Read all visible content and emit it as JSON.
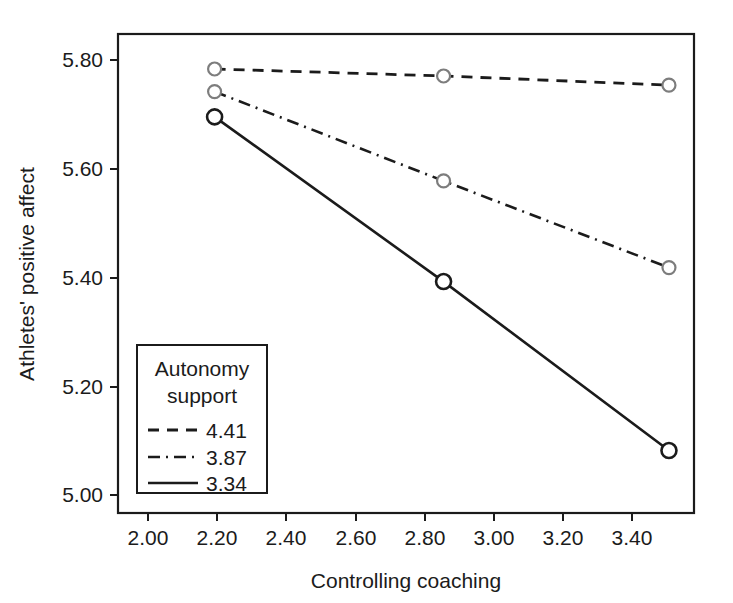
{
  "chart_data": {
    "type": "line",
    "title": "",
    "xlabel": "Controlling coaching",
    "ylabel": "Athletes' positive affect",
    "xlim": [
      1.92,
      3.53
    ],
    "ylim": [
      4.955,
      5.845
    ],
    "xticks": [
      "2.00",
      "2.20",
      "2.40",
      "2.60",
      "2.80",
      "3.00",
      "3.20",
      "3.40"
    ],
    "xtick_values": [
      2.0,
      2.2,
      2.4,
      2.6,
      2.8,
      3.0,
      3.2,
      3.4
    ],
    "yticks": [
      "5.00",
      "5.20",
      "5.40",
      "5.60",
      "5.80"
    ],
    "ytick_values": [
      5.0,
      5.2,
      5.4,
      5.6,
      5.8
    ],
    "grid": false,
    "legend_position": "lower-left-inside",
    "legend_title_line1": "Autonomy",
    "legend_title_line2": "support",
    "x": [
      2.19,
      2.83,
      3.46
    ],
    "series": [
      {
        "name": "4.41",
        "style": "dashed",
        "marker": "open-circle-gray",
        "values": [
          5.78,
          5.767,
          5.75
        ]
      },
      {
        "name": "3.87",
        "style": "dash-dot",
        "marker": "open-circle-gray",
        "values": [
          5.738,
          5.572,
          5.411
        ]
      },
      {
        "name": "3.34",
        "style": "solid",
        "marker": "open-circle-black",
        "values": [
          5.691,
          5.385,
          5.071
        ]
      }
    ]
  },
  "colors": {
    "axis": "#1b1b1b",
    "line": "#1b1b1b",
    "marker_light": "#7d7d7d",
    "background": "#ffffff"
  }
}
